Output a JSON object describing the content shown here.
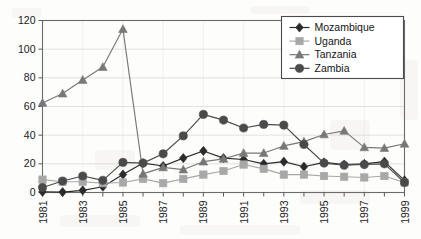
{
  "chart_data": {
    "type": "line",
    "title": "",
    "subtitle": "",
    "xlabel": "",
    "ylabel": "",
    "grid": true,
    "legend_position": "top-right",
    "x": [
      1981,
      1982,
      1983,
      1984,
      1985,
      1986,
      1987,
      1988,
      1989,
      1990,
      1991,
      1992,
      1993,
      1994,
      1995,
      1996,
      1997,
      1998,
      1999
    ],
    "xlim": [
      1981,
      1999
    ],
    "ylim": [
      0,
      120
    ],
    "yticks": [
      0,
      20,
      40,
      60,
      80,
      100,
      120
    ],
    "xticks_labeled": [
      1981,
      1983,
      1985,
      1987,
      1989,
      1991,
      1993,
      1995,
      1997,
      1999
    ],
    "xtick_labels": [
      "1981",
      "1983",
      "1985",
      "1987",
      "1989",
      "1991",
      "1993",
      "1995",
      "1997",
      "1999"
    ],
    "ytick_labels": [
      "0",
      "20",
      "40",
      "60",
      "80",
      "100",
      "120"
    ],
    "series": [
      {
        "name": "Mozambique",
        "marker": "diamond",
        "color": "#2b2b2b",
        "values": [
          0.5,
          0.3,
          1.5,
          4.0,
          12.5,
          20.5,
          18.5,
          24.0,
          29.0,
          24.0,
          23.0,
          20.0,
          21.5,
          18.0,
          21.0,
          19.5,
          20.0,
          21.5,
          8.5
        ]
      },
      {
        "name": "Uganda",
        "marker": "square",
        "color": "#a8a8a8",
        "values": [
          9.0,
          7.5,
          7.5,
          6.5,
          7.0,
          9.5,
          6.5,
          9.5,
          12.5,
          15.0,
          19.5,
          16.5,
          12.5,
          12.5,
          11.5,
          11.0,
          10.5,
          11.5,
          7.0
        ]
      },
      {
        "name": "Tanzania",
        "marker": "triangle",
        "color": "#787878",
        "values": [
          62.5,
          69.0,
          78.5,
          87.5,
          114.0,
          13.0,
          17.5,
          16.0,
          21.5,
          23.5,
          27.5,
          27.5,
          32.5,
          35.5,
          40.5,
          43.0,
          31.5,
          31.0,
          34.0
        ]
      },
      {
        "name": "Zambia",
        "marker": "circle",
        "color": "#4a4a4a",
        "values": [
          3.5,
          8.0,
          11.5,
          8.5,
          21.0,
          20.5,
          27.0,
          39.5,
          54.5,
          50.5,
          45.0,
          47.5,
          47.0,
          33.5,
          20.5,
          19.0,
          19.5,
          20.0,
          7.0
        ]
      }
    ]
  },
  "legend": {
    "items": [
      {
        "label": "Mozambique"
      },
      {
        "label": "Uganda"
      },
      {
        "label": "Tanzania"
      },
      {
        "label": "Zambia"
      }
    ]
  }
}
